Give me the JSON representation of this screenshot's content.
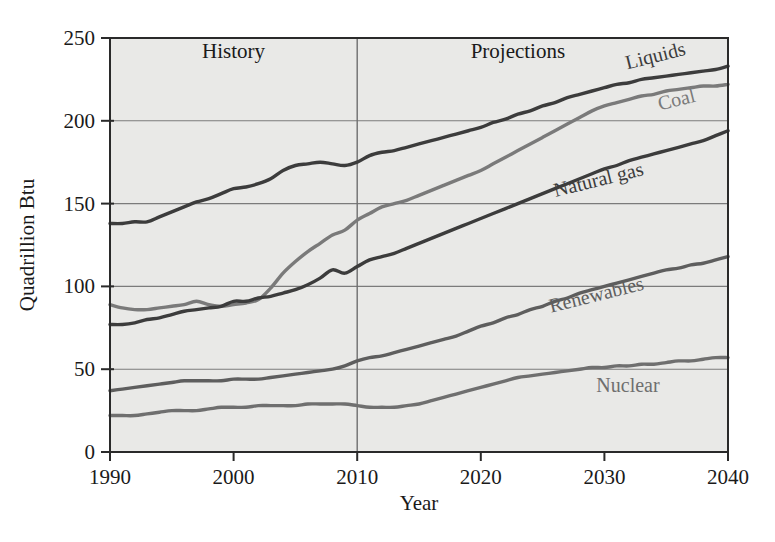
{
  "chart_data": {
    "type": "line",
    "title": "",
    "xlabel": "Year",
    "ylabel": "Quadrillion Btu",
    "xlim": [
      1990,
      2040
    ],
    "ylim": [
      0,
      250
    ],
    "grid": true,
    "legend_position": "inline-right",
    "x_ticks": [
      "1990",
      "2000",
      "2010",
      "2020",
      "2030",
      "2040"
    ],
    "x_tick_values": [
      1990,
      2000,
      2010,
      2020,
      2030,
      2040
    ],
    "y_ticks": [
      "0",
      "50",
      "100",
      "150",
      "200",
      "250"
    ],
    "y_tick_values": [
      0,
      50,
      100,
      150,
      200,
      250
    ],
    "annotations": [
      {
        "text": "History",
        "x": 2000,
        "y": 238
      },
      {
        "text": "Projections",
        "x": 2023,
        "y": 238
      }
    ],
    "divider_x": 2010,
    "x": [
      1990,
      1991,
      1992,
      1993,
      1994,
      1995,
      1996,
      1997,
      1998,
      1999,
      2000,
      2001,
      2002,
      2003,
      2004,
      2005,
      2006,
      2007,
      2008,
      2009,
      2010,
      2011,
      2012,
      2013,
      2014,
      2015,
      2016,
      2017,
      2018,
      2019,
      2020,
      2021,
      2022,
      2023,
      2024,
      2025,
      2026,
      2027,
      2028,
      2029,
      2030,
      2031,
      2032,
      2033,
      2034,
      2035,
      2036,
      2037,
      2038,
      2039,
      2040
    ],
    "series": [
      {
        "name": "Liquids",
        "color": "#3c3c3c",
        "label_rotation": -14,
        "values": [
          138,
          138,
          139,
          139,
          142,
          145,
          148,
          151,
          153,
          156,
          159,
          160,
          162,
          165,
          170,
          173,
          174,
          175,
          174,
          173,
          175,
          179,
          181,
          182,
          184,
          186,
          188,
          190,
          192,
          194,
          196,
          199,
          201,
          204,
          206,
          209,
          211,
          214,
          216,
          218,
          220,
          222,
          223,
          225,
          226,
          227,
          228,
          229,
          230,
          231,
          233
        ]
      },
      {
        "name": "Coal",
        "color": "#7a7a7a",
        "label_rotation": -14,
        "values": [
          89,
          87,
          86,
          86,
          87,
          88,
          89,
          91,
          89,
          88,
          89,
          90,
          92,
          99,
          108,
          115,
          121,
          126,
          131,
          134,
          140,
          144,
          148,
          150,
          152,
          155,
          158,
          161,
          164,
          167,
          170,
          174,
          178,
          182,
          186,
          190,
          194,
          198,
          202,
          206,
          209,
          211,
          213,
          215,
          216,
          218,
          219,
          220,
          221,
          221,
          222
        ]
      },
      {
        "name": "Natural gas",
        "color": "#3c3c3c",
        "label_rotation": -14,
        "values": [
          77,
          77,
          78,
          80,
          81,
          83,
          85,
          86,
          87,
          88,
          91,
          91,
          93,
          94,
          96,
          98,
          101,
          105,
          110,
          108,
          112,
          116,
          118,
          120,
          123,
          126,
          129,
          132,
          135,
          138,
          141,
          144,
          147,
          150,
          153,
          156,
          159,
          162,
          165,
          168,
          171,
          173,
          176,
          178,
          180,
          182,
          184,
          186,
          188,
          191,
          194
        ]
      },
      {
        "name": "Renewables",
        "color": "#5e5e5e",
        "label_rotation": -14,
        "values": [
          37,
          38,
          39,
          40,
          41,
          42,
          43,
          43,
          43,
          43,
          44,
          44,
          44,
          45,
          46,
          47,
          48,
          49,
          50,
          52,
          55,
          57,
          58,
          60,
          62,
          64,
          66,
          68,
          70,
          73,
          76,
          78,
          81,
          83,
          86,
          88,
          91,
          93,
          96,
          98,
          100,
          102,
          104,
          106,
          108,
          110,
          111,
          113,
          114,
          116,
          118
        ]
      },
      {
        "name": "Nuclear",
        "color": "#6f6f6f",
        "label_rotation": 0,
        "values": [
          22,
          22,
          22,
          23,
          24,
          25,
          25,
          25,
          26,
          27,
          27,
          27,
          28,
          28,
          28,
          28,
          29,
          29,
          29,
          29,
          28,
          27,
          27,
          27,
          28,
          29,
          31,
          33,
          35,
          37,
          39,
          41,
          43,
          45,
          46,
          47,
          48,
          49,
          50,
          51,
          51,
          52,
          52,
          53,
          53,
          54,
          55,
          55,
          56,
          57,
          57
        ]
      }
    ],
    "series_label_anchors": [
      {
        "name": "Liquids",
        "x_px": 657,
        "y_px": 62
      },
      {
        "name": "Coal",
        "x_px": 678,
        "y_px": 106
      },
      {
        "name": "Natural gas",
        "x_px": 600,
        "y_px": 186
      },
      {
        "name": "Renewables",
        "x_px": 598,
        "y_px": 301
      },
      {
        "name": "Nuclear",
        "x_px": 628,
        "y_px": 392
      }
    ]
  }
}
